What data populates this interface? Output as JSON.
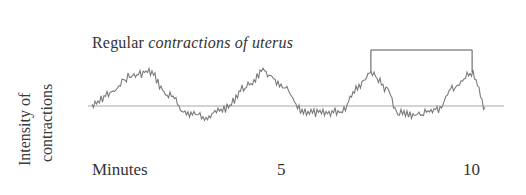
{
  "chart_data": {
    "type": "line",
    "title": "Regular contractions of uterus",
    "title_parts": {
      "normal": "Regular ",
      "italic": "contractions of uterus"
    },
    "xlabel": "Minutes",
    "ylabel": "Intensity of contractions",
    "ylabel_lines": [
      "Intensity of",
      "contractions"
    ],
    "x_ticks": [
      {
        "value": 5,
        "label": "5"
      },
      {
        "value": 10,
        "label": "10"
      }
    ],
    "xlim": [
      0,
      10.3
    ],
    "baseline": {
      "label": "",
      "relative_level": 0.5
    },
    "series": [
      {
        "name": "Uterine contraction intensity",
        "color": "#7a7a7a",
        "pattern": "periodic contractions with small noise",
        "peaks_minutes": [
          1.5,
          4.5,
          7.3,
          9.95
        ],
        "x": [
          0.0,
          0.5,
          1.0,
          1.5,
          2.0,
          2.5,
          3.0,
          3.5,
          4.0,
          4.5,
          5.0,
          5.5,
          6.0,
          6.5,
          7.0,
          7.3,
          7.7,
          8.0,
          8.5,
          9.0,
          9.5,
          9.95,
          10.3
        ],
        "values": [
          0.35,
          0.6,
          0.92,
          1.0,
          0.55,
          0.2,
          0.15,
          0.3,
          0.7,
          1.0,
          0.7,
          0.25,
          0.2,
          0.25,
          0.75,
          1.0,
          0.7,
          0.2,
          0.18,
          0.25,
          0.7,
          1.0,
          0.3
        ]
      }
    ],
    "annotation": {
      "type": "bracket",
      "from_minutes": 7.3,
      "to_minutes": 9.95,
      "meaning": "interval between contractions"
    },
    "grid": false,
    "legend": "none"
  },
  "labels": {
    "x_axis": "Minutes",
    "tick_5": "5",
    "tick_10": "10"
  },
  "colors": {
    "trace": "#7a7a7a",
    "baseline": "#c4c4c4",
    "bracket": "#555555",
    "text": "#333333"
  }
}
